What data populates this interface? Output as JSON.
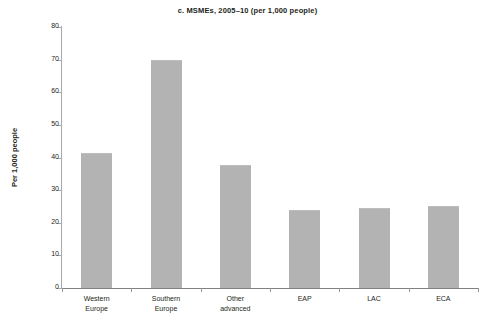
{
  "chart_data": {
    "type": "bar",
    "title": "c. MSMEs, 2005–10 (per 1,000 people)",
    "xlabel": "",
    "ylabel": "Per 1,000 people",
    "categories": [
      "Western Europe",
      "Southern Europe",
      "Other advanced",
      "EAP",
      "LAC",
      "ECA"
    ],
    "category_lines": [
      [
        "Western",
        "Europe"
      ],
      [
        "Southern",
        "Europe"
      ],
      [
        "Other",
        "advanced"
      ],
      [
        "EAP"
      ],
      [
        "LAC"
      ],
      [
        "ECA"
      ]
    ],
    "values": [
      41.4,
      70.0,
      37.7,
      24.0,
      24.5,
      25.0
    ],
    "ylim": [
      0,
      80
    ],
    "ytick_values": [
      0,
      10,
      20,
      30,
      40,
      50,
      60,
      70,
      80
    ],
    "ytick_labels": [
      "0",
      "10",
      "20",
      "30",
      "40",
      "50",
      "60",
      "70",
      "80"
    ],
    "grid": false,
    "legend": null,
    "bar_color": "#b3b3b3",
    "axis_color": "#939598",
    "text_color": "#231f20",
    "background": "#ffffff"
  }
}
